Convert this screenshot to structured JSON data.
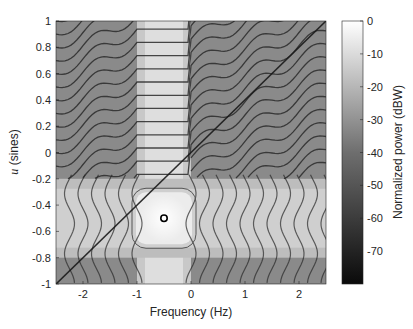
{
  "chart_data": {
    "type": "heatmap",
    "title": "",
    "xlabel": "Frequency (Hz)",
    "ylabel_italic": "u",
    "ylabel_rest": " (sines)",
    "ylabel": "u (sines)",
    "xlim": [
      -2.5,
      2.5
    ],
    "ylim": [
      -1,
      1
    ],
    "xticks": [
      -2,
      -1,
      0,
      1,
      2
    ],
    "xtick_labels": [
      "-2",
      "-1",
      "0",
      "1",
      "2"
    ],
    "yticks": [
      1,
      0.8,
      0.6,
      0.4,
      0.2,
      0,
      -0.2,
      -0.4,
      -0.6,
      -0.8,
      -1
    ],
    "ytick_labels": [
      "1",
      "0.8",
      "0.6",
      "0.4",
      "0.2",
      "0",
      "-0.2",
      "-0.4",
      "-0.6",
      "-0.8",
      "-1"
    ],
    "colormap": "gray",
    "colorbar": {
      "label": "Normalized power (dBW)",
      "range": [
        -80,
        0
      ],
      "ticks": [
        0,
        -10,
        -20,
        -30,
        -40,
        -50,
        -60,
        -70
      ],
      "tick_labels": [
        "0",
        "-10",
        "-20",
        "-30",
        "-40",
        "-50",
        "-60",
        "-70"
      ]
    },
    "peak_marker": {
      "frequency": -0.5,
      "u": -0.5,
      "shape": "circle"
    },
    "features": {
      "bright_vertical_band_frequency": [
        -1.0,
        0.0
      ],
      "bright_horizontal_band_u": [
        -0.8,
        -0.2
      ],
      "diagonal_ridge": {
        "from": [
          -2.5,
          -1.0
        ],
        "to": [
          2.5,
          1.0
        ]
      }
    },
    "grid": false,
    "legend": null
  }
}
